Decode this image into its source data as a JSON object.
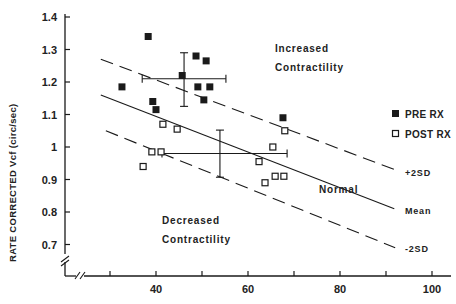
{
  "chart_data": {
    "type": "scatter",
    "title": "",
    "xlabel": "",
    "ylabel": "RATE CORRECTED Vcf (circ/sec)",
    "xlim": [
      25,
      105
    ],
    "ylim": [
      0.63,
      1.42
    ],
    "x_ticks": [
      30,
      40,
      50,
      60,
      70,
      80,
      90,
      100
    ],
    "x_tick_labels": [
      "",
      "40",
      "",
      "60",
      "",
      "80",
      "",
      "100"
    ],
    "y_ticks": [
      0.7,
      0.8,
      0.9,
      1.0,
      1.1,
      1.2,
      1.3,
      1.4
    ],
    "y_tick_labels": [
      "0.7",
      "0.8",
      "0.9",
      "1",
      "1.1",
      "1.2",
      "1.3",
      "1.4"
    ],
    "grid": false,
    "axis_breaks": [
      "x",
      "y"
    ],
    "legend": {
      "position": "right",
      "entries": [
        {
          "label": "PRE RX",
          "marker": "filled-square"
        },
        {
          "label": "POST RX",
          "marker": "open-square"
        }
      ]
    },
    "series": [
      {
        "name": "PRE RX",
        "marker": "filled-square",
        "points": [
          [
            32.6,
            1.185
          ],
          [
            38.3,
            1.34
          ],
          [
            39.3,
            1.14
          ],
          [
            40.0,
            1.115
          ],
          [
            45.7,
            1.22
          ],
          [
            48.7,
            1.28
          ],
          [
            50.9,
            1.265
          ],
          [
            49.1,
            1.185
          ],
          [
            51.7,
            1.185
          ],
          [
            50.4,
            1.145
          ],
          [
            67.6,
            1.09
          ]
        ]
      },
      {
        "name": "POST RX",
        "marker": "open-square",
        "points": [
          [
            41.5,
            1.07
          ],
          [
            44.6,
            1.055
          ],
          [
            39.1,
            0.985
          ],
          [
            41.1,
            0.985
          ],
          [
            37.2,
            0.94
          ],
          [
            68.0,
            1.05
          ],
          [
            65.4,
            1.0
          ],
          [
            62.4,
            0.955
          ],
          [
            63.7,
            0.89
          ],
          [
            65.9,
            0.91
          ],
          [
            67.8,
            0.91
          ]
        ]
      }
    ],
    "error_crosses": [
      {
        "series": "PRE RX",
        "x_mean": 46.1,
        "y_mean": 1.21,
        "x_range": [
          37.0,
          55.2
        ],
        "y_range": [
          1.125,
          1.29
        ]
      },
      {
        "series": "POST RX",
        "x_mean": 53.9,
        "y_mean": 0.98,
        "x_range": [
          41.3,
          68.5
        ],
        "y_range": [
          0.907,
          1.052
        ]
      }
    ],
    "reference_lines": [
      {
        "label": "+2SD",
        "style": "dashed",
        "from": [
          28.0,
          1.27
        ],
        "to": [
          92.0,
          0.93
        ]
      },
      {
        "label": "Mean",
        "style": "solid",
        "from": [
          28.0,
          1.16
        ],
        "to": [
          91.8,
          0.81
        ]
      },
      {
        "label": "-2SD",
        "style": "dashed",
        "from": [
          29.1,
          1.05
        ],
        "to": [
          92.0,
          0.69
        ]
      }
    ],
    "annotations": [
      {
        "text": "Increased Contractility",
        "x": 71,
        "y": 1.22
      },
      {
        "text": "Normal",
        "x": 78,
        "y": 0.93
      },
      {
        "text": "Decreased Contractility",
        "x": 44,
        "y": 0.78
      }
    ]
  },
  "labels": {
    "ylabel": "RATE CORRECTED Vcf (circ/sec)",
    "increased_1": "Increased",
    "increased_2": "Contractility",
    "decreased_1": "Decreased",
    "decreased_2": "Contractility",
    "normal": "Normal",
    "plus2sd": "+2SD",
    "mean": "Mean",
    "minus2sd": "-2SD",
    "legend_pre": "PRE RX",
    "legend_post": "POST RX"
  },
  "colors": {
    "ink": "#1a1a1a",
    "background": "#ffffff"
  }
}
